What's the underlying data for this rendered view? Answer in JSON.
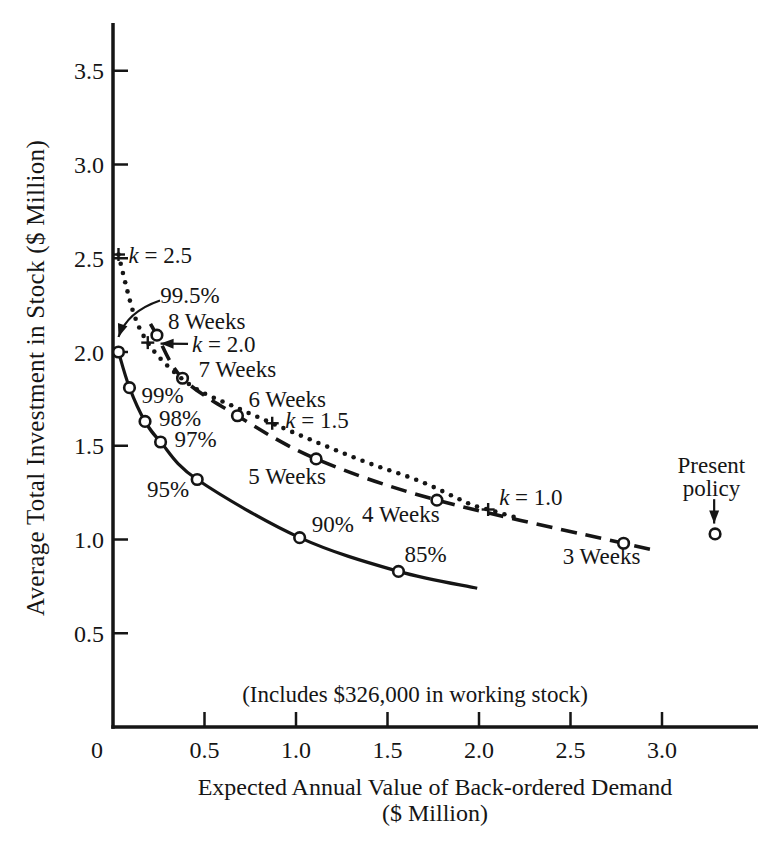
{
  "chart_data": {
    "type": "line",
    "title": "",
    "xlabel_line1": "Expected Annual Value of Back-ordered Demand",
    "xlabel_line2": "($ Million)",
    "ylabel": "Average Total Investment in Stock ($ Million)",
    "note": "(Includes $326,000 in working stock)",
    "xlim": [
      0,
      3.52
    ],
    "ylim": [
      0,
      3.75
    ],
    "grid": false,
    "ink_color": "#151515",
    "background_color": "#ffffff",
    "xticks": [
      {
        "v": 0,
        "label": "0",
        "dx": -16
      },
      {
        "v": 0.5,
        "label": "0.5"
      },
      {
        "v": 1,
        "label": "1.0"
      },
      {
        "v": 1.5,
        "label": "1.5"
      },
      {
        "v": 2,
        "label": "2.0"
      },
      {
        "v": 2.5,
        "label": "2.5"
      },
      {
        "v": 3,
        "label": "3.0"
      }
    ],
    "yticks": [
      {
        "v": 0.5,
        "label": "0.5"
      },
      {
        "v": 1,
        "label": "1.0"
      },
      {
        "v": 1.5,
        "label": "1.5"
      },
      {
        "v": 2,
        "label": "2.0"
      },
      {
        "v": 2.5,
        "label": "2.5"
      },
      {
        "v": 3,
        "label": "3.0"
      },
      {
        "v": 3.5,
        "label": "3.5"
      }
    ],
    "series": [
      {
        "name": "service-level",
        "style": "solid",
        "marker": "circle",
        "points": [
          {
            "x": 0.03,
            "y": 2.0,
            "m": 1
          },
          {
            "x": 0.09,
            "y": 1.81,
            "m": 1,
            "label": "99%",
            "dx": 12,
            "dy": 7,
            "anchor": "start"
          },
          {
            "x": 0.175,
            "y": 1.63,
            "m": 1,
            "label": "98%",
            "dx": 14,
            "dy": -3,
            "anchor": "start"
          },
          {
            "x": 0.26,
            "y": 1.52,
            "m": 1,
            "label": "97%",
            "dx": 14,
            "dy": -3,
            "anchor": "start"
          },
          {
            "x": 0.46,
            "y": 1.32,
            "m": 1,
            "label": "95%",
            "dx": -8,
            "dy": 9,
            "anchor": "end"
          },
          {
            "x": 1.02,
            "y": 1.01,
            "m": 1,
            "label": "90%",
            "dx": 12,
            "dy": -14,
            "anchor": "start"
          },
          {
            "x": 1.56,
            "y": 0.83,
            "m": 1,
            "label": "85%",
            "dx": 6,
            "dy": -17,
            "anchor": "start"
          },
          {
            "x": 1.99,
            "y": 0.74
          }
        ]
      },
      {
        "name": "weeks-of-supply",
        "style": "dashed",
        "marker": "circle",
        "points": [
          {
            "x": 0.205,
            "y": 2.15
          },
          {
            "x": 0.24,
            "y": 2.09,
            "m": 1,
            "label": "8 Weeks",
            "dx": 11,
            "dy": -14,
            "anchor": "start"
          },
          {
            "x": 0.38,
            "y": 1.86,
            "m": 1,
            "label": "7 Weeks",
            "dx": 16,
            "dy": -9,
            "anchor": "start"
          },
          {
            "x": 0.68,
            "y": 1.66,
            "m": 1,
            "label": "6 Weeks",
            "dx": 11,
            "dy": -17,
            "anchor": "start"
          },
          {
            "x": 1.11,
            "y": 1.43,
            "m": 1,
            "label": "5 Weeks",
            "dx": -29,
            "dy": 17,
            "anchor": "middle"
          },
          {
            "x": 1.77,
            "y": 1.21,
            "m": 1,
            "label": "4 Weeks",
            "dx": -36,
            "dy": 14,
            "anchor": "middle"
          },
          {
            "x": 2.79,
            "y": 0.98,
            "m": 1,
            "label": "3 Weeks",
            "dx": -22,
            "dy": 13,
            "anchor": "middle"
          },
          {
            "x": 2.98,
            "y": 0.94
          }
        ]
      },
      {
        "name": "safety-factor-k",
        "style": "dotted",
        "marker": "plus",
        "points": [
          {
            "x": 0.03,
            "y": 2.52,
            "m": 1,
            "label": "k = 2.5",
            "dx": 10,
            "dy": 0,
            "anchor": "start"
          },
          {
            "x": 0.11,
            "y": 2.215
          },
          {
            "x": 0.19,
            "y": 2.05,
            "m": 1
          },
          {
            "x": 0.31,
            "y": 1.915
          },
          {
            "x": 0.46,
            "y": 1.8
          },
          {
            "x": 0.66,
            "y": 1.71
          },
          {
            "x": 0.87,
            "y": 1.62,
            "m": 1,
            "label": "k = 1.5",
            "dx": 13,
            "dy": -3,
            "anchor": "start"
          },
          {
            "x": 1.11,
            "y": 1.52
          },
          {
            "x": 1.39,
            "y": 1.41
          },
          {
            "x": 1.68,
            "y": 1.31
          },
          {
            "x": 1.95,
            "y": 1.19
          },
          {
            "x": 2.05,
            "y": 1.16,
            "m": 1,
            "label": "k = 1.0",
            "dx": 11,
            "dy": -13,
            "anchor": "start"
          },
          {
            "x": 2.19,
            "y": 1.12
          }
        ]
      }
    ],
    "annotations": [
      {
        "id": "service-99-5",
        "text": "99.5%",
        "tx": 0.42,
        "ty": 2.305,
        "anchor": "middle",
        "arrow": {
          "from": [
            0.257,
            2.275
          ],
          "ctrl": [
            0.077,
            2.215
          ],
          "to": [
            0.03,
            2.08
          ]
        }
      },
      {
        "id": "k-2-0",
        "text": "k = 2.0",
        "tx": 0.432,
        "ty": 2.043,
        "anchor": "start",
        "arrow": {
          "from": [
            0.41,
            2.043
          ],
          "to": [
            0.26,
            2.045
          ]
        }
      },
      {
        "id": "present-policy",
        "lines": [
          "Present",
          "policy"
        ],
        "tx": 3.27,
        "ty": 1.4,
        "line_gap": 0.125,
        "anchor": "middle",
        "arrow": {
          "from": [
            3.285,
            1.215
          ],
          "to": [
            3.285,
            1.085
          ]
        },
        "point": {
          "x": 3.29,
          "y": 1.03
        }
      }
    ]
  }
}
